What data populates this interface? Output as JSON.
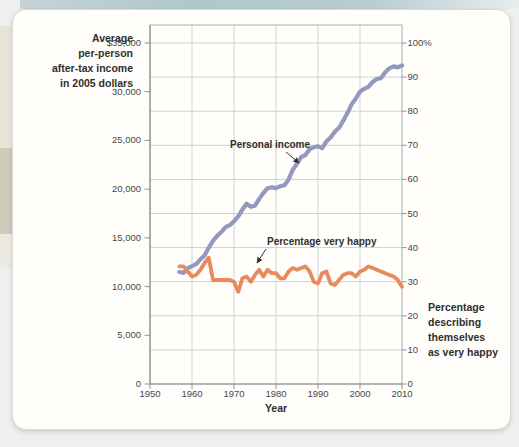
{
  "colors": {
    "income_line": "#9199bf",
    "happy_line": "#e78a5d",
    "grid": "#cdd1d4",
    "frame": "#a8adb0",
    "axis": "#8f9498",
    "teal_strip": "#aec7cd",
    "page_edge": "#d0cabb",
    "card_bg": "#fffefa"
  },
  "chart_data": {
    "type": "line",
    "title": "",
    "xlabel": "Year",
    "grid": {
      "horizontal_every_right_pct": 10,
      "vertical_every_years": 10
    },
    "x_axis": {
      "range": [
        1950,
        2010
      ],
      "tick_values": [
        1950,
        1960,
        1970,
        1980,
        1990,
        2000,
        2010
      ],
      "tick_labels": [
        "1950",
        "1960",
        "1970",
        "1980",
        "1990",
        "2000",
        "2010"
      ]
    },
    "left_axis": {
      "title_lines": [
        "Average",
        "per-person",
        "after-tax income",
        "in 2005 dollars"
      ],
      "range": [
        0,
        35000
      ],
      "tick_values": [
        35000,
        30000,
        25000,
        20000,
        15000,
        10000,
        5000,
        0
      ],
      "tick_labels": [
        "$35,000",
        "30,000",
        "25,000",
        "20,000",
        "15,000",
        "10,000",
        "5,000",
        "0"
      ]
    },
    "right_axis": {
      "title_lines": [
        "Percentage",
        "describing",
        "themselves",
        "as very happy"
      ],
      "range": [
        0,
        100
      ],
      "tick_values": [
        100,
        90,
        80,
        70,
        60,
        50,
        40,
        30,
        20,
        10,
        0
      ],
      "tick_labels": [
        "100%",
        "90",
        "80",
        "70",
        "60",
        "50",
        "40",
        "30",
        "20",
        "10",
        "0"
      ]
    },
    "years": [
      1957,
      1958,
      1959,
      1960,
      1961,
      1962,
      1963,
      1964,
      1965,
      1966,
      1967,
      1968,
      1969,
      1970,
      1971,
      1972,
      1973,
      1974,
      1975,
      1976,
      1977,
      1978,
      1979,
      1980,
      1981,
      1982,
      1983,
      1984,
      1985,
      1986,
      1987,
      1988,
      1989,
      1990,
      1991,
      1992,
      1993,
      1994,
      1995,
      1996,
      1997,
      1998,
      1999,
      2000,
      2001,
      2002,
      2003,
      2004,
      2005,
      2006,
      2007,
      2008,
      2009,
      2010
    ],
    "series": [
      {
        "name": "Personal income",
        "axis": "left",
        "color": "#9199bf",
        "values": [
          11500,
          11400,
          11900,
          12100,
          12300,
          12800,
          13200,
          14000,
          14700,
          15200,
          15600,
          16100,
          16300,
          16700,
          17200,
          17900,
          18500,
          18200,
          18300,
          19000,
          19600,
          20100,
          20200,
          20100,
          20300,
          20400,
          21000,
          22000,
          22600,
          23300,
          23500,
          24100,
          24300,
          24400,
          24200,
          24900,
          25300,
          25900,
          26300,
          27000,
          27800,
          28700,
          29300,
          30000,
          30300,
          30500,
          31000,
          31300,
          31400,
          32000,
          32400,
          32600,
          32500,
          32700
        ]
      },
      {
        "name": "Percentage very happy",
        "axis": "right",
        "color": "#e78a5d",
        "values": [
          34.5,
          34.5,
          33,
          31.5,
          32,
          33.5,
          35.5,
          37,
          30.5,
          30.5,
          30.5,
          30.5,
          30.5,
          30,
          27,
          31,
          31.5,
          30,
          32,
          33.5,
          31.5,
          33.5,
          32.5,
          32.5,
          31,
          31,
          33,
          34,
          33.5,
          34,
          34.5,
          33,
          30,
          29.5,
          32.5,
          33,
          29.5,
          29,
          30.5,
          32,
          32.5,
          32.5,
          31.5,
          33,
          33.5,
          34.5,
          34,
          33.5,
          33,
          32.5,
          32,
          31.5,
          30.5,
          28.5
        ]
      }
    ]
  }
}
